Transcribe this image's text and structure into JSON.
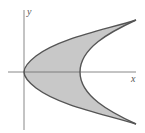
{
  "figure": {
    "axes": {
      "x_label": "x",
      "y_label": "y",
      "origin_px": [
        24,
        72
      ]
    },
    "colors": {
      "fill": "#c8c8c8",
      "curve": "#555555",
      "axis": "#6a6a6a",
      "background": "#ffffff"
    },
    "curves": {
      "outer": {
        "vertex_px": [
          24,
          72
        ],
        "upper_end_px": [
          136,
          20
        ],
        "lower_end_px": [
          136,
          124
        ]
      },
      "inner": {
        "vertex_px": [
          80,
          72
        ],
        "upper_end_px": [
          136,
          20
        ],
        "lower_end_px": [
          136,
          124
        ]
      }
    }
  }
}
